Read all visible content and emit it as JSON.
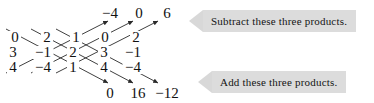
{
  "diagram": {
    "type": "determinant-diagonals",
    "grid": {
      "rows": 3,
      "cols": 5,
      "values": [
        [
          "0",
          "2",
          "1",
          "0",
          "2"
        ],
        [
          "3",
          "−1",
          "2",
          "3",
          "−1"
        ],
        [
          "4",
          "−4",
          "1",
          "4",
          "−4"
        ]
      ]
    },
    "top_products": [
      "−4",
      "0",
      "6"
    ],
    "bottom_products": [
      "0",
      "16",
      "−12"
    ],
    "up_arrows": 3,
    "down_arrows": 3,
    "line_color": "#2a2a2a"
  },
  "callouts": {
    "subtract": {
      "text": "Subtract these three products.",
      "direction": "left",
      "background": "#dcdcdc"
    },
    "add": {
      "text": "Add these three products.",
      "direction": "left",
      "background": "#dcdcdc"
    }
  }
}
